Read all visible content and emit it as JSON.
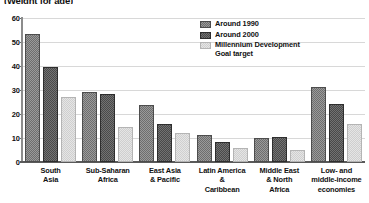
{
  "chart_data": {
    "type": "bar",
    "title": "(Weight for age)",
    "xlabel": "",
    "ylabel": "",
    "ylim": [
      0,
      60
    ],
    "yticks": [
      0,
      10,
      20,
      30,
      40,
      50,
      60
    ],
    "grid": true,
    "legend_position": "upper-right",
    "categories": [
      "South\nAsia",
      "Sub-Saharan\nAfrica",
      "East Asia\n& Pacific",
      "Latin America\n&\nCaribbean",
      "Middle East\n& North\nAfrica",
      "Low- and\nmiddle-income\neconomies"
    ],
    "series": [
      {
        "name": "Around 1990",
        "color": "#6e6e6e",
        "values": [
          52.5,
          28.2,
          23.0,
          10.3,
          9.0,
          30.4
        ]
      },
      {
        "name": "Around 2000",
        "color": "#4a4a4a",
        "values": [
          38.6,
          27.4,
          15.1,
          7.4,
          9.6,
          23.4
        ]
      },
      {
        "name": "Millennium Development\nGoal target",
        "color": "#cfcfcf",
        "values": [
          26.3,
          13.9,
          11.2,
          5.0,
          4.2,
          15.0
        ]
      }
    ]
  },
  "axis": {
    "ytick_labels": [
      "60",
      "50",
      "40",
      "30",
      "20",
      "10",
      "0"
    ]
  },
  "legend": {
    "items": [
      {
        "label": "Around 1990"
      },
      {
        "label": "Around 2000"
      },
      {
        "label": "Millennium Development\nGoal target"
      }
    ]
  }
}
